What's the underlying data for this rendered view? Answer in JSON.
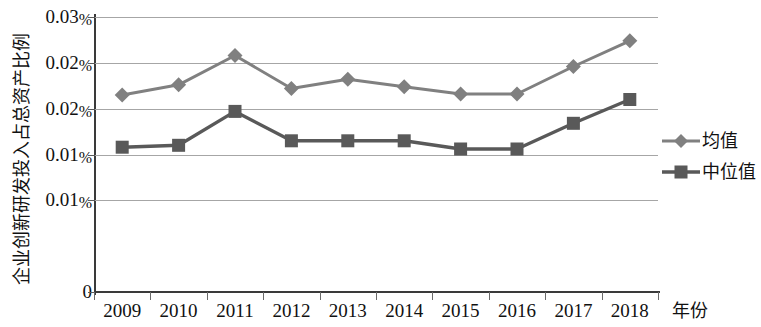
{
  "chart_data": {
    "type": "line",
    "title": "",
    "xlabel": "年份",
    "ylabel": "企业创新研发投入占总资产比例",
    "categories": [
      "2009",
      "2010",
      "2011",
      "2012",
      "2013",
      "2014",
      "2015",
      "2016",
      "2017",
      "2018"
    ],
    "ytick_labels": [
      "0.03%",
      "0.02%",
      "0.02%",
      "0.01%",
      "0.01%",
      "0"
    ],
    "ytick_values": [
      0.03,
      0.025,
      0.02,
      0.015,
      0.01,
      0
    ],
    "ylim": [
      0,
      0.03
    ],
    "grid": true,
    "legend_position": "right",
    "series": [
      {
        "name": "均值",
        "marker": "diamond",
        "color": "#808080",
        "values": [
          0.0215,
          0.0226,
          0.0258,
          0.0222,
          0.0232,
          0.0224,
          0.0216,
          0.0216,
          0.0246,
          0.0274
        ]
      },
      {
        "name": "中位值",
        "marker": "square",
        "color": "#595959",
        "values": [
          0.0158,
          0.016,
          0.0197,
          0.0165,
          0.0165,
          0.0165,
          0.0156,
          0.0156,
          0.0184,
          0.021
        ]
      }
    ]
  },
  "axes": {
    "y_title": "企业创新研发投入占总资产比例",
    "x_title": "年份"
  },
  "legend": {
    "items": [
      {
        "label": "均值"
      },
      {
        "label": "中位值"
      }
    ]
  },
  "colors": {
    "mean_series": "#808080",
    "median_series": "#595959",
    "gridline": "#a6a6a6",
    "axis": "#3a3a3a",
    "text": "#111111",
    "background": "#ffffff"
  }
}
